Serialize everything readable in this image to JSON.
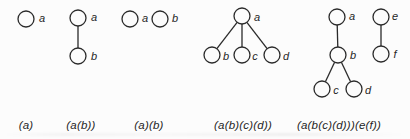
{
  "figure": {
    "style": {
      "node_radius": 8,
      "node_fill": "#fcfcfc",
      "stroke_color": "#2a2a2a",
      "stroke_width": 1.3
    },
    "diagrams": [
      {
        "caption": "(a)",
        "caption_x": 26,
        "caption_y": 119,
        "nodes": [
          {
            "id": "a",
            "x": 26,
            "y": 19,
            "label": "a",
            "label_x": 42,
            "label_y": 18
          }
        ],
        "edges": []
      },
      {
        "caption": "(a(b))",
        "caption_x": 81,
        "caption_y": 119,
        "nodes": [
          {
            "id": "a",
            "x": 78,
            "y": 18,
            "label": "a",
            "label_x": 94,
            "label_y": 17
          },
          {
            "id": "b",
            "x": 78,
            "y": 56,
            "label": "b",
            "label_x": 94,
            "label_y": 56
          }
        ],
        "edges": [
          [
            "a",
            "b"
          ]
        ]
      },
      {
        "caption": "(a)(b)",
        "caption_x": 149,
        "caption_y": 119,
        "nodes": [
          {
            "id": "a",
            "x": 130,
            "y": 19,
            "label": "a",
            "label_x": 145,
            "label_y": 18
          },
          {
            "id": "b",
            "x": 160,
            "y": 19,
            "label": "b",
            "label_x": 175,
            "label_y": 18
          }
        ],
        "edges": []
      },
      {
        "caption": "(a(b)(c)(d))",
        "caption_x": 243,
        "caption_y": 119,
        "nodes": [
          {
            "id": "a",
            "x": 242,
            "y": 16,
            "label": "a",
            "label_x": 257,
            "label_y": 17
          },
          {
            "id": "b",
            "x": 212,
            "y": 55,
            "label": "b",
            "label_x": 226,
            "label_y": 56
          },
          {
            "id": "c",
            "x": 242,
            "y": 55,
            "label": "c",
            "label_x": 255,
            "label_y": 56
          },
          {
            "id": "d",
            "x": 272,
            "y": 55,
            "label": "d",
            "label_x": 286,
            "label_y": 56
          }
        ],
        "edges": [
          [
            "a",
            "b"
          ],
          [
            "a",
            "c"
          ],
          [
            "a",
            "d"
          ]
        ]
      },
      {
        "caption": "(a(b(c)(d)))(e(f))",
        "caption_x": 339,
        "caption_y": 119,
        "nodes": [
          {
            "id": "a",
            "x": 337,
            "y": 17,
            "label": "a",
            "label_x": 352,
            "label_y": 16
          },
          {
            "id": "b",
            "x": 338,
            "y": 55,
            "label": "b",
            "label_x": 353,
            "label_y": 55
          },
          {
            "id": "c",
            "x": 322,
            "y": 89,
            "label": "c",
            "label_x": 336,
            "label_y": 90
          },
          {
            "id": "d",
            "x": 354,
            "y": 89,
            "label": "d",
            "label_x": 368,
            "label_y": 90
          },
          {
            "id": "e",
            "x": 381,
            "y": 17,
            "label": "e",
            "label_x": 395,
            "label_y": 16
          },
          {
            "id": "f",
            "x": 381,
            "y": 54,
            "label": "f",
            "label_x": 395,
            "label_y": 54
          }
        ],
        "edges": [
          [
            "a",
            "b"
          ],
          [
            "b",
            "c"
          ],
          [
            "b",
            "d"
          ],
          [
            "e",
            "f"
          ]
        ]
      }
    ]
  }
}
